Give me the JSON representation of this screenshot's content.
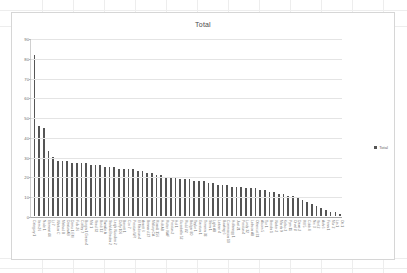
{
  "workbook": {
    "background_color": "#ffffff",
    "gridline_color": "#ededed"
  },
  "chart": {
    "title": "Total",
    "border_color": "#d6d6d6",
    "series_color": "#555555",
    "legend": {
      "label": "Total",
      "position": "right",
      "swatch_color": "#555555"
    }
  },
  "chart_data": {
    "type": "bar",
    "title": "Total",
    "xlabel": "",
    "ylabel": "",
    "ylim": [
      0,
      90
    ],
    "yticks": [
      0,
      10,
      20,
      30,
      40,
      50,
      60,
      70,
      80,
      90
    ],
    "grid": true,
    "legend_position": "right",
    "series": [
      {
        "name": "Total",
        "color": "#555555",
        "values": [
          82,
          46,
          45,
          33,
          30,
          28,
          28,
          28,
          27,
          27,
          27,
          27,
          26,
          26,
          26,
          25,
          25,
          25,
          24,
          24,
          24,
          24,
          23,
          23,
          22,
          22,
          21,
          21,
          20,
          20,
          20,
          19,
          19,
          19,
          18,
          18,
          18,
          17,
          17,
          16,
          16,
          16,
          15,
          15,
          15,
          14,
          14,
          14,
          13,
          13,
          12,
          12,
          11,
          11,
          10,
          10,
          9,
          8,
          7,
          6,
          5,
          4,
          3,
          2,
          2,
          1
        ]
      }
    ],
    "categories": [
      "Category 1",
      "Item 26",
      "Node 1",
      "Element 44",
      "Lt 7",
      "Whitton C",
      "Method B",
      "Denton AB",
      "Demo 1 EM",
      "Fulk 26",
      "Cottley 7",
      "Burgin 1 Green 4",
      "Mal 1",
      "Vead 32",
      "Burdi 12",
      "Twinkle A",
      "Stahl & Braden 2",
      "Leigh Woodlea 2",
      "Duffy 106",
      "Barrett 1",
      "Cox 7",
      "Preston WR",
      "El Madison 4",
      "Arnett 6",
      "Bennard 27",
      "Mallory CA",
      "Ronald 156",
      "Holt AB",
      "Rutter WAF",
      "Preston 2",
      "Hol 1",
      "Gusabella 52",
      "Rudd 82",
      "Badger 80",
      "Taylor 1",
      "Garston 1",
      "Trimmin 38",
      "Stern 1",
      "Light AB",
      "Lattner 4",
      "Bowling 6",
      "Commission 10",
      "Hollenegg 1",
      "Jost 21",
      "Preston 4",
      "Lordy 32",
      "Lathron AB",
      "Othercot 31",
      "Alcorn 5",
      "Tur 1",
      "Breslin 1",
      "Walter 2",
      "Marsh 9",
      "Kelso 3",
      "Pym 11",
      "Orval 8",
      "Dawe 2",
      "Rill 5",
      "Cobb 4",
      "Nix 3",
      "Verl 2",
      "Ash 6",
      "Fenn 1",
      "Mor 2",
      "Lin 1",
      "Ott 1"
    ]
  }
}
